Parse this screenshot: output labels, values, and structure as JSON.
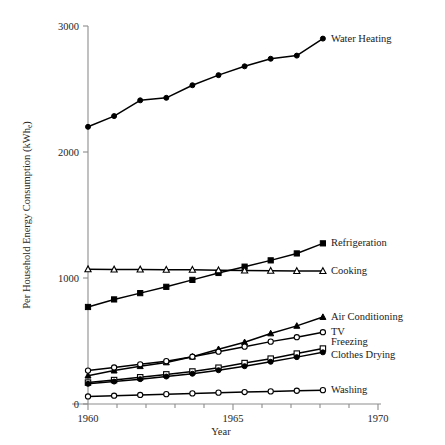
{
  "chart_data": {
    "type": "line",
    "title": "",
    "xlabel": "Year",
    "ylabel": "Per Household Energy Consumption (kWh",
    "ylabel_sub": "e",
    "ylabel_suffix": ")",
    "xlim": [
      1960,
      1970
    ],
    "ylim": [
      0,
      3000
    ],
    "xticks": [
      1960,
      1965,
      1970
    ],
    "xtick_labels": [
      "1960",
      "1965",
      "1970"
    ],
    "xtick_minor": [
      1961,
      1962,
      1963,
      1964,
      1966,
      1967,
      1968,
      1969
    ],
    "yticks": [
      0,
      1000,
      2000,
      3000
    ],
    "ytick_labels": [
      "0",
      "1000",
      "2000",
      "3000"
    ],
    "grid": false,
    "legend_position": "right-inline-annotations",
    "line_color": "#000000",
    "axis_color": "#8d8d8d",
    "series": [
      {
        "name": "Water Heating",
        "marker": "filled-circle",
        "x": [
          1960.0,
          1960.9,
          1961.8,
          1962.7,
          1963.6,
          1964.5,
          1965.4,
          1966.3,
          1967.2,
          1968.1
        ],
        "values": [
          2200,
          2285,
          2410,
          2430,
          2530,
          2610,
          2680,
          2740,
          2765,
          2900
        ]
      },
      {
        "name": "Refrigeration",
        "marker": "filled-square",
        "x": [
          1960.0,
          1960.9,
          1961.8,
          1962.7,
          1963.6,
          1964.5,
          1965.4,
          1966.3,
          1967.2,
          1968.1
        ],
        "values": [
          770,
          830,
          880,
          930,
          985,
          1040,
          1090,
          1140,
          1195,
          1275
        ]
      },
      {
        "name": "Cooking",
        "marker": "open-triangle",
        "x": [
          1960.0,
          1960.9,
          1961.8,
          1962.7,
          1963.6,
          1964.5,
          1965.4,
          1966.3,
          1967.2,
          1968.1
        ],
        "values": [
          1070,
          1068,
          1068,
          1065,
          1065,
          1062,
          1060,
          1058,
          1055,
          1055
        ]
      },
      {
        "name": "Air Conditioning",
        "marker": "filled-triangle",
        "x": [
          1960.0,
          1960.9,
          1961.8,
          1962.7,
          1963.6,
          1964.5,
          1965.4,
          1966.3,
          1967.2,
          1968.1
        ],
        "values": [
          225,
          265,
          300,
          330,
          375,
          435,
          490,
          560,
          620,
          690
        ]
      },
      {
        "name": "TV",
        "marker": "open-circle",
        "x": [
          1960.0,
          1960.9,
          1961.8,
          1962.7,
          1963.6,
          1964.5,
          1965.4,
          1966.3,
          1967.2,
          1968.1
        ],
        "values": [
          265,
          290,
          315,
          340,
          375,
          415,
          455,
          495,
          530,
          570
        ]
      },
      {
        "name": "Freezing",
        "marker": "open-square",
        "x": [
          1960.0,
          1960.9,
          1961.8,
          1962.7,
          1963.6,
          1964.5,
          1965.4,
          1966.3,
          1967.2,
          1968.1
        ],
        "values": [
          170,
          190,
          212,
          235,
          258,
          288,
          325,
          360,
          400,
          440
        ]
      },
      {
        "name": "Clothes Drying",
        "marker": "filled-circle",
        "x": [
          1960.0,
          1960.9,
          1961.8,
          1962.7,
          1963.6,
          1964.5,
          1965.4,
          1966.3,
          1967.2,
          1968.1
        ],
        "values": [
          160,
          178,
          197,
          218,
          240,
          268,
          300,
          335,
          372,
          410
        ]
      },
      {
        "name": "Washing",
        "marker": "open-circle",
        "x": [
          1960.0,
          1960.9,
          1961.8,
          1962.7,
          1963.6,
          1964.5,
          1965.4,
          1966.3,
          1967.2,
          1968.1
        ],
        "values": [
          60,
          66,
          72,
          78,
          84,
          90,
          95,
          100,
          105,
          110
        ]
      }
    ],
    "annotations": [
      {
        "text": "Water Heating",
        "series": "Water Heating"
      },
      {
        "text": "Refrigeration",
        "series": "Refrigeration"
      },
      {
        "text": "Cooking",
        "series": "Cooking"
      },
      {
        "text": "Air Conditioning",
        "series": "Air Conditioning"
      },
      {
        "text": "TV",
        "series": "TV"
      },
      {
        "text": "Freezing",
        "series": "Freezing"
      },
      {
        "text": "Clothes Drying",
        "series": "Clothes Drying"
      },
      {
        "text": "Washing",
        "series": "Washing"
      }
    ]
  },
  "labels": {
    "series_0": "Water Heating",
    "series_1": "Refrigeration",
    "series_2": "Cooking",
    "series_3": "Air Conditioning",
    "series_4": "TV",
    "series_5": "Freezing",
    "series_6": "Clothes Drying",
    "series_7": "Washing"
  }
}
